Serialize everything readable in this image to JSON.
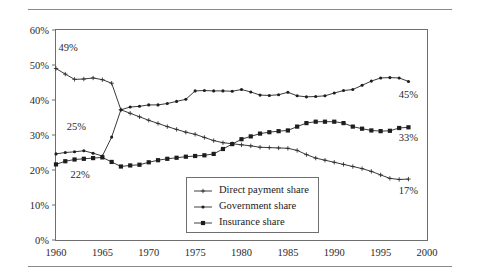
{
  "figure": {
    "top_rule": "",
    "bottom_rule": ""
  },
  "chart_data": {
    "type": "line",
    "title": "",
    "subtitle": "",
    "xlabel": "",
    "ylabel": "",
    "xlim": [
      1960,
      2000
    ],
    "ylim": [
      0,
      60
    ],
    "grid": false,
    "legend_position": "inside-bottom-center",
    "y_ticks": [
      "0%",
      "10%",
      "20%",
      "30%",
      "40%",
      "50%",
      "60%"
    ],
    "y_tick_values": [
      0,
      10,
      20,
      30,
      40,
      50,
      60
    ],
    "x_ticks": [
      "1960",
      "1965",
      "1970",
      "1975",
      "1980",
      "1985",
      "1990",
      "1995",
      "2000"
    ],
    "x_tick_values": [
      1960,
      1965,
      1970,
      1975,
      1980,
      1985,
      1990,
      1995,
      2000
    ],
    "x": [
      1960,
      1961,
      1962,
      1963,
      1964,
      1965,
      1966,
      1967,
      1968,
      1969,
      1970,
      1971,
      1972,
      1973,
      1974,
      1975,
      1976,
      1977,
      1978,
      1979,
      1980,
      1981,
      1982,
      1983,
      1984,
      1985,
      1986,
      1987,
      1988,
      1989,
      1990,
      1991,
      1992,
      1993,
      1994,
      1995,
      1996,
      1997,
      1998
    ],
    "series": [
      {
        "name": "Direct payment share",
        "marker": "plus",
        "color": "#242424",
        "values": [
          49.0,
          47.4,
          45.9,
          46.0,
          46.3,
          45.8,
          44.8,
          37.2,
          36.2,
          35.2,
          34.2,
          33.3,
          32.4,
          31.6,
          30.8,
          30.2,
          29.3,
          28.4,
          27.8,
          27.5,
          27.2,
          26.9,
          26.5,
          26.4,
          26.3,
          26.2,
          25.6,
          24.4,
          23.4,
          22.8,
          22.2,
          21.6,
          21.0,
          20.4,
          19.6,
          18.6,
          17.6,
          17.3,
          17.4
        ],
        "label": {
          "text": "49%",
          "x": 1961.3,
          "y": 54.0
        },
        "end_label": {
          "text": "17%",
          "x": 1998.0,
          "y": 13.2
        }
      },
      {
        "name": "Government share",
        "marker": "dot",
        "color": "#242424",
        "values": [
          24.6,
          25.0,
          25.2,
          25.5,
          24.8,
          24.0,
          29.4,
          37.2,
          38.0,
          38.2,
          38.6,
          38.6,
          39.0,
          39.6,
          40.2,
          42.6,
          42.7,
          42.6,
          42.6,
          42.5,
          43.0,
          42.3,
          41.4,
          41.3,
          41.5,
          42.2,
          41.2,
          40.9,
          41.0,
          41.2,
          42.0,
          42.7,
          43.0,
          44.2,
          45.4,
          46.3,
          46.4,
          46.3,
          45.3
        ],
        "label": {
          "text": "25%",
          "x": 1962.2,
          "y": 31.5
        },
        "end_label": {
          "text": "45%",
          "x": 1998.0,
          "y": 40.5
        }
      },
      {
        "name": "Insurance share",
        "marker": "square",
        "color": "#242424",
        "values": [
          21.6,
          22.5,
          23.0,
          23.2,
          23.4,
          23.6,
          22.3,
          21.0,
          21.3,
          21.5,
          22.2,
          22.8,
          23.2,
          23.5,
          23.8,
          24.0,
          24.2,
          24.6,
          26.0,
          27.4,
          28.8,
          29.6,
          30.4,
          30.8,
          31.1,
          31.3,
          32.4,
          33.4,
          33.8,
          33.8,
          33.8,
          33.4,
          32.4,
          31.8,
          31.3,
          31.1,
          31.2,
          32.0,
          32.2
        ],
        "label": {
          "text": "22%",
          "x": 1962.6,
          "y": 17.8
        },
        "end_label": {
          "text": "33%",
          "x": 1998.0,
          "y": 28.4
        }
      }
    ],
    "legend": [
      {
        "label": "Direct payment share",
        "marker": "plus"
      },
      {
        "label": "Government share",
        "marker": "dot"
      },
      {
        "label": "Insurance share",
        "marker": "square"
      }
    ]
  }
}
